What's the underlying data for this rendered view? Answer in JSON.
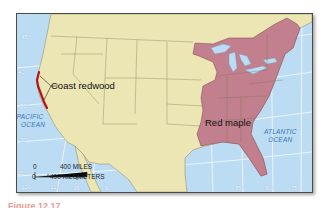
{
  "map": {
    "colors": {
      "ocean": "#bcdcf3",
      "land": "#ece5b4",
      "red_maple": "#c27f8e",
      "coast_redwood": "#b3121b",
      "state_lines": "#7d7550",
      "graticule": "#ffffff",
      "ocean_label": "#3a78b8"
    },
    "species_labels": {
      "coast_redwood": "Coast redwood",
      "red_maple": "Red maple"
    },
    "ocean_labels": {
      "pacific_line1": "PACIFIC",
      "pacific_line2": "OCEAN",
      "atlantic_line1": "ATLANTIC",
      "atlantic_line2": "OCEAN"
    },
    "latitudes": [
      "45°",
      "40°",
      "35°",
      "30°",
      "25°"
    ],
    "longitudes": [
      "120°",
      "115°",
      "95°",
      "90°",
      "85°",
      "80°",
      "75°"
    ],
    "scale_bar": {
      "zero_top": "0",
      "miles": "400 MILES",
      "zero_bottom": "0",
      "kilometers": "400 KILOMETERS"
    }
  },
  "caption": {
    "partial_text": "Figure 12.17"
  }
}
